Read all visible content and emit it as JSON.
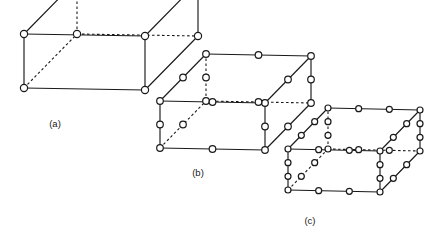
{
  "figure": {
    "background_color": "#ffffff",
    "line_color": "#1a1a1a",
    "node_fill_color": "#ffffff",
    "width": 440,
    "height": 240,
    "panels": [
      {
        "id": "panel-a",
        "caption": "(a)",
        "caption_x": 55,
        "caption_y": 124,
        "element_type": "8-node linear hexahedron",
        "divisions_per_edge": 1,
        "nodes_per_edge_interior": 0,
        "total_nodes": 8,
        "origin_x": 24,
        "origin_y": 88,
        "axis_u": [
          121,
          2
        ],
        "axis_v": [
          53,
          -54
        ],
        "axis_w": [
          0,
          -54
        ],
        "node_radius": 3.6
      },
      {
        "id": "panel-b",
        "caption": "(b)",
        "caption_x": 198,
        "caption_y": 173,
        "element_type": "20-node quadratic hexahedron",
        "divisions_per_edge": 2,
        "nodes_per_edge_interior": 1,
        "total_nodes": 20,
        "origin_x": 160,
        "origin_y": 148,
        "axis_u": [
          105,
          2
        ],
        "axis_v": [
          46,
          -47
        ],
        "axis_w": [
          0,
          -47
        ],
        "node_radius": 3.3
      },
      {
        "id": "panel-c",
        "caption": "(c)",
        "caption_x": 310,
        "caption_y": 221,
        "element_type": "32-node cubic hexahedron",
        "divisions_per_edge": 3,
        "nodes_per_edge_interior": 2,
        "total_nodes": 32,
        "origin_x": 288,
        "origin_y": 190,
        "axis_u": [
          92,
          2
        ],
        "axis_v": [
          40,
          -41
        ],
        "axis_w": [
          0,
          -41
        ],
        "node_radius": 3.0
      }
    ]
  }
}
